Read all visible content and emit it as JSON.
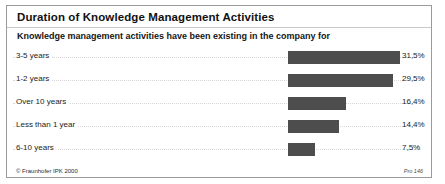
{
  "chart_data": {
    "type": "bar",
    "orientation": "horizontal",
    "title": "Duration of Knowledge Management Activities",
    "subtitle": "Knowledge management activities have been existing in the company for",
    "xlabel": "",
    "ylabel": "",
    "grid": true,
    "legend": false,
    "bar_color": "#4d4d4d",
    "xlim": [
      0,
      33
    ],
    "categories": [
      "3-5 years",
      "1-2 years",
      "Over 10 years",
      "Less than 1 year",
      "6-10 years"
    ],
    "values": [
      31.5,
      29.5,
      16.4,
      14.4,
      7.5
    ],
    "value_labels": [
      "31,5%",
      "29,5%",
      "16,4%",
      "14,4%",
      "7,5%"
    ],
    "rows": [
      {
        "category": "3-5 years",
        "value": 31.5,
        "value_label": "31,5%"
      },
      {
        "category": "1-2 years",
        "value": 29.5,
        "value_label": "29,5%"
      },
      {
        "category": "Over 10 years",
        "value": 16.4,
        "value_label": "16,4%"
      },
      {
        "category": "Less than 1 year",
        "value": 14.4,
        "value_label": "14,4%"
      },
      {
        "category": "6-10 years",
        "value": 7.5,
        "value_label": "7,5%"
      }
    ]
  },
  "footer": {
    "copyright": "© Fraunhofer IPK 2000",
    "source_ref": "Pro 146"
  }
}
